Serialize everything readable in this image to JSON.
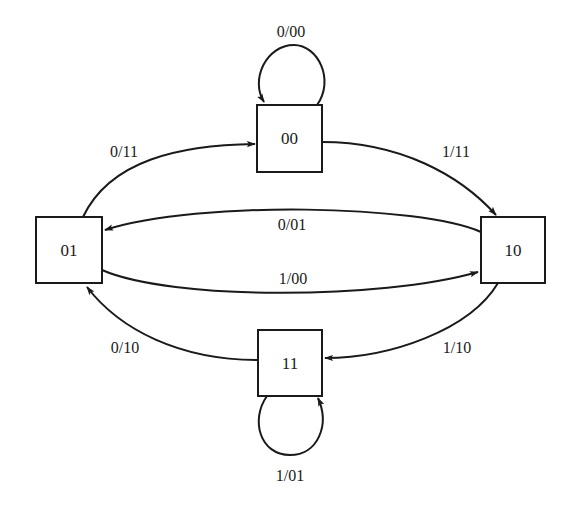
{
  "diagram": {
    "type": "state-transition",
    "colors": {
      "stroke": "#1a1a1a",
      "background": "#ffffff"
    },
    "states": [
      {
        "id": "00",
        "label": "00"
      },
      {
        "id": "01",
        "label": "01"
      },
      {
        "id": "10",
        "label": "10"
      },
      {
        "id": "11",
        "label": "11"
      }
    ],
    "transitions": [
      {
        "from": "00",
        "to": "00",
        "label": "0/00"
      },
      {
        "from": "00",
        "to": "10",
        "label": "1/11"
      },
      {
        "from": "01",
        "to": "00",
        "label": "0/11"
      },
      {
        "from": "10",
        "to": "01",
        "label": "0/01"
      },
      {
        "from": "01",
        "to": "10",
        "label": "1/00"
      },
      {
        "from": "10",
        "to": "11",
        "label": "1/10"
      },
      {
        "from": "11",
        "to": "01",
        "label": "0/10"
      },
      {
        "from": "11",
        "to": "11",
        "label": "1/01"
      }
    ]
  }
}
